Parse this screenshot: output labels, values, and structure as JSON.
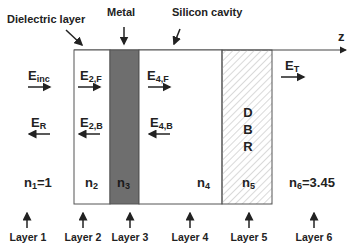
{
  "diagram": {
    "type": "layered optical structure",
    "top_labels": {
      "dielectric": "Dielectric layer",
      "metal": "Metal",
      "silicon": "Silicon cavity"
    },
    "axis_label": "z",
    "fields": {
      "inc": {
        "base": "E",
        "sub": "inc"
      },
      "r": {
        "base": "E",
        "sub": "R"
      },
      "f2": {
        "base": "E",
        "sub": "2,F"
      },
      "b2": {
        "base": "E",
        "sub": "2,B"
      },
      "f4": {
        "base": "E",
        "sub": "4,F"
      },
      "b4": {
        "base": "E",
        "sub": "4,B"
      },
      "t": {
        "base": "E",
        "sub": "T"
      }
    },
    "dbr": {
      "d": "D",
      "b": "B",
      "r": "R"
    },
    "indices": {
      "n1": {
        "base": "n",
        "sub": "1",
        "rest": "=1"
      },
      "n2": {
        "base": "n",
        "sub": "2",
        "rest": ""
      },
      "n3": {
        "base": "n",
        "sub": "3",
        "rest": ""
      },
      "n4": {
        "base": "n",
        "sub": "4",
        "rest": ""
      },
      "n5": {
        "base": "n",
        "sub": "5",
        "rest": ""
      },
      "n6": {
        "base": "n",
        "sub": "6",
        "rest": "=3.45"
      }
    },
    "layers": [
      "Layer 1",
      "Layer 2",
      "Layer 3",
      "Layer 4",
      "Layer 5",
      "Layer 6"
    ],
    "colors": {
      "metal_fill": "#6e6e6e",
      "outline": "#555555",
      "hatch": "#c8c8c8",
      "text": "#222222"
    }
  }
}
